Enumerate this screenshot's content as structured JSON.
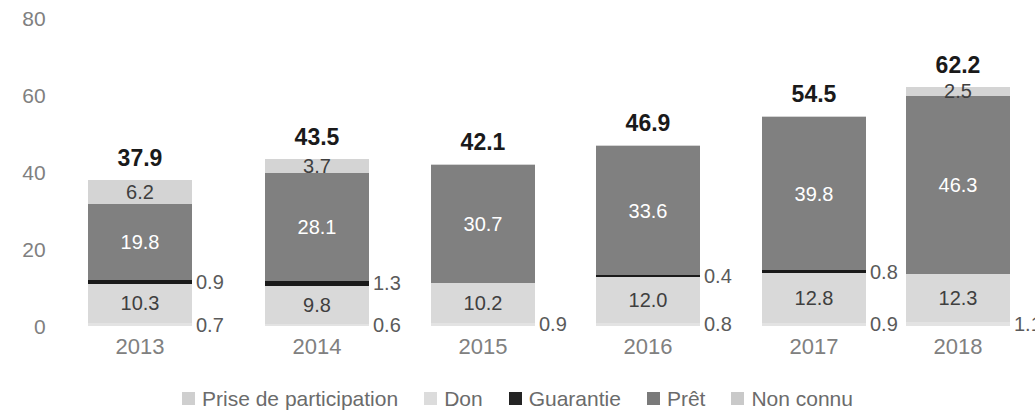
{
  "chart_data": {
    "type": "bar",
    "subtype": "stacked-vertical",
    "title": "",
    "subtitle": "",
    "xlabel": "",
    "ylabel": "",
    "ylim": [
      0,
      80
    ],
    "yticks": [
      "0",
      "20",
      "40",
      "60",
      "80"
    ],
    "ytick_values": [
      0,
      20,
      40,
      60,
      80
    ],
    "grid": false,
    "legend_position": "bottom",
    "categories": [
      "2013",
      "2014",
      "2015",
      "2016",
      "2017",
      "2018"
    ],
    "series": [
      {
        "name": "Prise de participation",
        "color": "#e3e3e3",
        "values": [
          0.7,
          0.6,
          0.9,
          0.8,
          0.9,
          1.1
        ]
      },
      {
        "name": "Don",
        "color": "#d9d9d9",
        "values": [
          10.3,
          9.8,
          10.2,
          12.0,
          12.8,
          12.3
        ]
      },
      {
        "name": "Guarantie",
        "color": "#1a1a1a",
        "values": [
          0.9,
          1.3,
          0.0,
          0.4,
          0.8,
          0.0
        ]
      },
      {
        "name": "Prêt",
        "color": "#808080",
        "values": [
          19.8,
          28.1,
          30.7,
          33.6,
          39.8,
          46.3
        ]
      },
      {
        "name": "Non connu",
        "color": "#d4d4d4",
        "values": [
          6.2,
          3.7,
          0.3,
          0.1,
          0.2,
          2.5
        ]
      }
    ],
    "totals": [
      "37.9",
      "43.5",
      "42.1",
      "46.9",
      "54.5",
      "62.2"
    ],
    "total_values": [
      37.9,
      43.5,
      42.1,
      46.9,
      54.5,
      62.2
    ]
  },
  "axis": {
    "y_ticks": [
      {
        "label": "80",
        "value": 80
      },
      {
        "label": "60",
        "value": 60
      },
      {
        "label": "40",
        "value": 40
      },
      {
        "label": "20",
        "value": 20
      },
      {
        "label": "0",
        "value": 0
      }
    ],
    "x_ticks": [
      {
        "label": "2013"
      },
      {
        "label": "2014"
      },
      {
        "label": "2015"
      },
      {
        "label": "2016"
      },
      {
        "label": "2017"
      },
      {
        "label": "2018"
      }
    ]
  },
  "legend": {
    "items": [
      {
        "label": "Prise de participation",
        "color": "#cfcfcf"
      },
      {
        "label": "Don",
        "color": "#dcdcdc"
      },
      {
        "label": "Guarantie",
        "color": "#242424"
      },
      {
        "label": "Prêt",
        "color": "#7a7a7a"
      },
      {
        "label": "Non connu",
        "color": "#c9c9c9"
      }
    ]
  },
  "bars": [
    {
      "year": "2013",
      "total": "37.9",
      "inside_labels": [
        {
          "text": "10.3",
          "series": "Don",
          "tone": "dark"
        },
        {
          "text": "19.8",
          "series": "Prêt",
          "tone": "light"
        },
        {
          "text": "6.2",
          "series": "Non connu",
          "tone": "dark"
        }
      ],
      "outside_labels": [
        {
          "text": "0.7",
          "series": "Prise de participation"
        },
        {
          "text": "0.9",
          "series": "Guarantie"
        }
      ]
    },
    {
      "year": "2014",
      "total": "43.5",
      "inside_labels": [
        {
          "text": "9.8",
          "series": "Don",
          "tone": "dark"
        },
        {
          "text": "28.1",
          "series": "Prêt",
          "tone": "light"
        },
        {
          "text": "3.7",
          "series": "Non connu",
          "tone": "dark"
        }
      ],
      "outside_labels": [
        {
          "text": "0.6",
          "series": "Prise de participation"
        },
        {
          "text": "1.3",
          "series": "Guarantie"
        }
      ]
    },
    {
      "year": "2015",
      "total": "42.1",
      "inside_labels": [
        {
          "text": "10.2",
          "series": "Don",
          "tone": "dark"
        },
        {
          "text": "30.7",
          "series": "Prêt",
          "tone": "light"
        }
      ],
      "outside_labels": [
        {
          "text": "0.9",
          "series": "Prise de participation"
        }
      ]
    },
    {
      "year": "2016",
      "total": "46.9",
      "inside_labels": [
        {
          "text": "12.0",
          "series": "Don",
          "tone": "dark"
        },
        {
          "text": "33.6",
          "series": "Prêt",
          "tone": "light"
        }
      ],
      "outside_labels": [
        {
          "text": "0.8",
          "series": "Prise de participation"
        },
        {
          "text": "0.4",
          "series": "Guarantie"
        }
      ]
    },
    {
      "year": "2017",
      "total": "54.5",
      "inside_labels": [
        {
          "text": "12.8",
          "series": "Don",
          "tone": "dark"
        },
        {
          "text": "39.8",
          "series": "Prêt",
          "tone": "light"
        }
      ],
      "outside_labels": [
        {
          "text": "0.9",
          "series": "Prise de participation"
        },
        {
          "text": "0.8",
          "series": "Guarantie"
        }
      ]
    },
    {
      "year": "2018",
      "total": "62.2",
      "inside_labels": [
        {
          "text": "12.3",
          "series": "Don",
          "tone": "dark"
        },
        {
          "text": "46.3",
          "series": "Prêt",
          "tone": "light"
        },
        {
          "text": "2.5",
          "series": "Non connu",
          "tone": "dark"
        }
      ],
      "outside_labels": [
        {
          "text": "1.1",
          "series": "Prise de participation"
        }
      ]
    }
  ]
}
